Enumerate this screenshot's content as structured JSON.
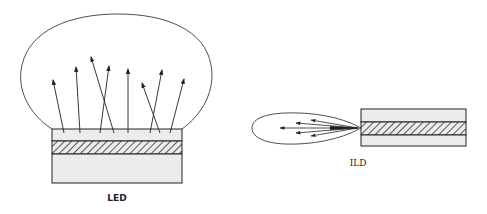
{
  "diagram": {
    "type": "emission-pattern-comparison",
    "colors": {
      "stroke": "#222222",
      "layer_fill": "#ececec",
      "hatch": "#333333",
      "background": "#ffffff"
    },
    "panels": [
      {
        "id": "led",
        "label": "LED",
        "description": "Wide lambertian emission lobe above surface-emitting chip",
        "layers": [
          "top-cladding",
          "active-layer-hatched",
          "substrate"
        ],
        "arrow_count": 8
      },
      {
        "id": "ild",
        "label": "ILD",
        "description": "Narrow emission lobe from edge of injection laser diode",
        "layers": [
          "top-cladding",
          "active-layer-hatched",
          "bottom-cladding"
        ],
        "arrow_count": 5
      }
    ]
  }
}
